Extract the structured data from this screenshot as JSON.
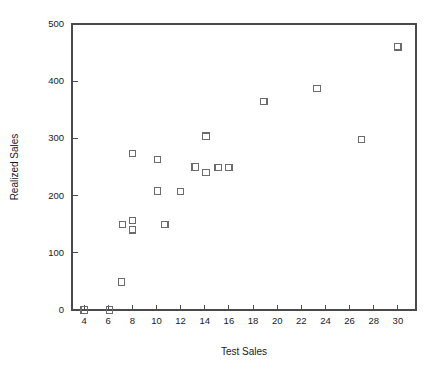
{
  "chart_data": {
    "type": "scatter",
    "title": "",
    "xlabel": "Test Sales",
    "ylabel": "Realized Sales",
    "xlim": [
      3,
      31.5
    ],
    "ylim": [
      0,
      500
    ],
    "xticks": [
      4,
      6,
      8,
      10,
      12,
      14,
      16,
      18,
      20,
      22,
      24,
      26,
      28,
      30
    ],
    "yticks": [
      0,
      100,
      200,
      300,
      400,
      500
    ],
    "grid": false,
    "legend": null,
    "marker": "open-square",
    "marker_color": "#6b6b6b",
    "points": [
      {
        "x": 4.0,
        "y": 0
      },
      {
        "x": 6.1,
        "y": 0
      },
      {
        "x": 7.1,
        "y": 49
      },
      {
        "x": 7.2,
        "y": 150
      },
      {
        "x": 8.0,
        "y": 157
      },
      {
        "x": 8.0,
        "y": 140
      },
      {
        "x": 8.0,
        "y": 273
      },
      {
        "x": 10.1,
        "y": 263
      },
      {
        "x": 10.1,
        "y": 208
      },
      {
        "x": 10.7,
        "y": 149
      },
      {
        "x": 12.0,
        "y": 207
      },
      {
        "x": 13.2,
        "y": 250
      },
      {
        "x": 14.1,
        "y": 304
      },
      {
        "x": 14.1,
        "y": 241
      },
      {
        "x": 15.1,
        "y": 249
      },
      {
        "x": 16.0,
        "y": 249
      },
      {
        "x": 18.9,
        "y": 365
      },
      {
        "x": 23.3,
        "y": 387
      },
      {
        "x": 27.0,
        "y": 298
      },
      {
        "x": 30.0,
        "y": 460
      }
    ]
  },
  "axis": {
    "x_title": "Test Sales",
    "y_title": "Realized Sales",
    "x_tick_labels": [
      "4",
      "6",
      "8",
      "10",
      "12",
      "14",
      "16",
      "18",
      "20",
      "22",
      "24",
      "26",
      "28",
      "30"
    ],
    "y_tick_labels": [
      "0",
      "100",
      "200",
      "300",
      "400",
      "500"
    ]
  },
  "colors": {
    "axis": "#4a4a4a",
    "marker": "#6b6b6b",
    "text": "#1a1a1a",
    "background": "#ffffff"
  }
}
